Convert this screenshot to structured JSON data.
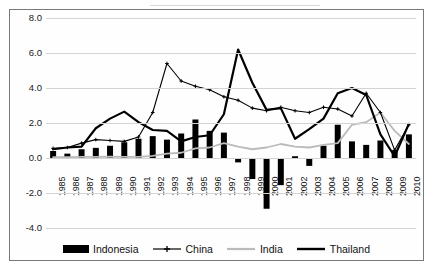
{
  "chart_data": {
    "type": "bar",
    "title": "",
    "xlabel": "",
    "ylabel": "",
    "ylim": [
      -4.0,
      8.0
    ],
    "grid": true,
    "legend_position": "bottom",
    "categories": [
      "1985",
      "1986",
      "1987",
      "1988",
      "1989",
      "1990",
      "1991",
      "1992",
      "1993",
      "1994",
      "1995",
      "1996",
      "1997",
      "1998",
      "1999",
      "2000",
      "2001",
      "2002",
      "2003",
      "2004",
      "2005",
      "2006",
      "2007",
      "2008",
      "2009",
      "2010"
    ],
    "y_ticks": [
      "8.0",
      "6.0",
      "4.0",
      "2.0",
      "0.0",
      "-2.0",
      "-4.0"
    ],
    "y_tick_values": [
      8.0,
      6.0,
      4.0,
      2.0,
      0.0,
      -2.0,
      -4.0
    ],
    "series": [
      {
        "name": "Indonesia",
        "type": "bar",
        "color": "#000000",
        "values": [
          0.4,
          0.25,
          0.5,
          0.58,
          0.7,
          0.9,
          1.1,
          1.25,
          1.05,
          1.4,
          2.2,
          1.55,
          1.45,
          -0.25,
          -1.2,
          -2.9,
          -1.55,
          0.1,
          -0.45,
          0.7,
          1.9,
          0.95,
          0.75,
          1.0,
          0.45,
          1.35
        ]
      },
      {
        "name": "China",
        "type": "line",
        "marker": "cross",
        "color": "#000000",
        "values": [
          0.55,
          0.6,
          0.85,
          1.05,
          1.0,
          0.95,
          1.2,
          2.6,
          5.4,
          4.4,
          4.1,
          3.9,
          3.5,
          3.3,
          2.85,
          2.7,
          2.9,
          2.7,
          2.6,
          2.9,
          2.8,
          2.4,
          3.7,
          2.6,
          0.45,
          1.9
        ]
      },
      {
        "name": "India",
        "type": "line",
        "color": "#bbbbbb",
        "values": [
          0.05,
          0.05,
          0.06,
          0.07,
          0.08,
          0.07,
          0.07,
          0.12,
          0.25,
          0.3,
          0.55,
          0.6,
          0.85,
          0.65,
          0.5,
          0.6,
          0.8,
          0.65,
          0.6,
          0.75,
          0.85,
          1.9,
          2.05,
          2.6,
          1.55,
          0.8
        ]
      },
      {
        "name": "Thailand",
        "type": "line",
        "color": "#000000",
        "values": [
          0.5,
          0.6,
          0.65,
          1.7,
          2.25,
          2.65,
          2.05,
          1.6,
          1.55,
          0.95,
          1.2,
          1.3,
          2.5,
          6.2,
          4.3,
          2.75,
          2.85,
          1.1,
          1.65,
          2.25,
          3.7,
          4.0,
          3.6,
          1.35,
          0.1,
          1.95
        ]
      }
    ]
  },
  "legend": {
    "items": [
      {
        "label": "Indonesia",
        "marker": "bar",
        "color": "#000000"
      },
      {
        "label": "China",
        "marker": "line-cross",
        "color": "#000000"
      },
      {
        "label": "India",
        "marker": "line-gray",
        "color": "#bbbbbb"
      },
      {
        "label": "Thailand",
        "marker": "line-thick",
        "color": "#000000"
      }
    ]
  }
}
